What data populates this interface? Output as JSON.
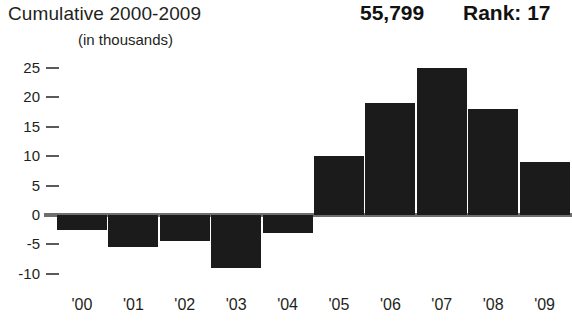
{
  "header": {
    "title": "Cumulative 2000-2009",
    "subtitle": "(in thousands)",
    "total": "55,799",
    "rank": "Rank: 17"
  },
  "chart_data": {
    "type": "bar",
    "title": "Cumulative 2000-2009",
    "subtitle": "(in thousands)",
    "xlabel": "",
    "ylabel": "",
    "categories": [
      "'00",
      "'01",
      "'02",
      "'03",
      "'04",
      "'05",
      "'06",
      "'07",
      "'08",
      "'09"
    ],
    "values": [
      -2.5,
      -5.5,
      -4.5,
      -9,
      -3,
      10,
      19,
      25,
      18,
      9
    ],
    "ylim": [
      -10,
      25
    ],
    "yticks": [
      25,
      20,
      15,
      10,
      5,
      0,
      -5,
      -10
    ],
    "ytick_labels": [
      "25",
      "20",
      "15",
      "10",
      "5",
      "0",
      "-5",
      "-10"
    ],
    "grid": false,
    "legend": false,
    "bar_color": "#1b1b1b",
    "baseline_color": "#6f6f6f",
    "annotations": [
      "55,799",
      "Rank: 17"
    ]
  }
}
